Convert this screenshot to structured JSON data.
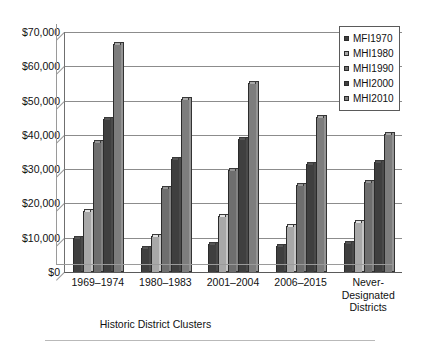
{
  "chart_data": {
    "type": "bar",
    "title": "",
    "xlabel": "Historic District Clusters",
    "ylabel": "",
    "categories": [
      "1969–1974",
      "1980–1983",
      "2001–2004",
      "2006–2015",
      "Never-\nDesignated\nDistricts"
    ],
    "series": [
      {
        "name": "MFI1970",
        "color": "#3f3f3f",
        "values": [
          10000,
          7100,
          8200,
          7700,
          8600
        ]
      },
      {
        "name": "MHI1980",
        "color": "#a8a8a8",
        "values": [
          17800,
          10600,
          16200,
          13400,
          14700
        ]
      },
      {
        "name": "MHI1990",
        "color": "#6e6e6e",
        "values": [
          38000,
          24400,
          29900,
          25300,
          26300
        ]
      },
      {
        "name": "MHI2000",
        "color": "#3f3f3f",
        "values": [
          44700,
          33100,
          38900,
          31600,
          32200
        ]
      },
      {
        "name": "MHI2010",
        "color": "#7d7d7d",
        "values": [
          66500,
          50400,
          55000,
          45100,
          40300
        ]
      }
    ],
    "ylim": [
      0,
      70000
    ],
    "yticks": [
      0,
      10000,
      20000,
      30000,
      40000,
      50000,
      60000,
      70000
    ],
    "ytick_labels": [
      "$0",
      "$10,000",
      "$20,000",
      "$30,000",
      "$40,000",
      "$50,000",
      "$60,000",
      "$70,000"
    ],
    "grid": true,
    "legend_position": "top-right",
    "legend_entries": [
      "MFI1970",
      "MHI1980",
      "MHI1990",
      "MHI2000",
      "MHI2010"
    ]
  }
}
